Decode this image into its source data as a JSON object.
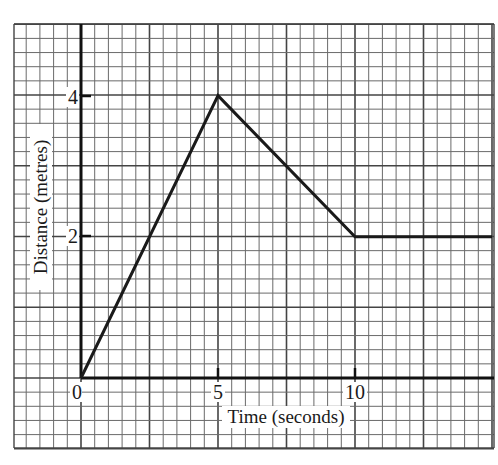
{
  "chart_data": {
    "type": "line",
    "title": "",
    "xlabel": "Time (seconds)",
    "ylabel": "Distance (metres)",
    "x_ticks": [
      "0",
      "5",
      "10"
    ],
    "y_ticks": [
      "2",
      "4"
    ],
    "xlim": [
      -2.5,
      15
    ],
    "ylim": [
      -1,
      5
    ],
    "grid": true,
    "legend": null,
    "series": [
      {
        "name": "distance",
        "x": [
          0,
          5,
          10,
          15
        ],
        "y": [
          0,
          4,
          2,
          2
        ]
      }
    ],
    "colors": {
      "line": "#1a1a1a",
      "grid": "#555555",
      "axis": "#111111"
    }
  },
  "labels": {
    "xlabel": "Time (seconds)",
    "ylabel": "Distance (metres)",
    "x0": "0",
    "x5": "5",
    "x10": "10",
    "y2": "2",
    "y4": "4"
  }
}
